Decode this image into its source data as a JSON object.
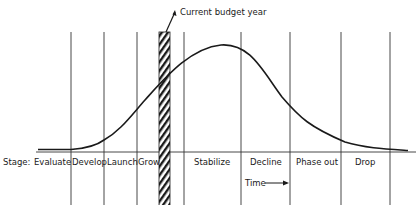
{
  "diagram": {
    "type": "product-life-cycle",
    "callout": "Current budget year",
    "stage_prefix": "Stage:",
    "stages": [
      "Evaluate",
      "Develop",
      "Launch",
      "Grow",
      "Stabilize",
      "Decline",
      "Phase out",
      "Drop"
    ],
    "time_axis_label": "Time",
    "colors": {
      "ink": "#1a1a1a",
      "background": "#ffffff"
    }
  }
}
